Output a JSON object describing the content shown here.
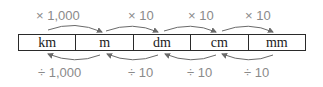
{
  "units": [
    {
      "label": "km"
    },
    {
      "label": "m"
    },
    {
      "label": "dm"
    },
    {
      "label": "cm"
    },
    {
      "label": "mm"
    }
  ],
  "multiply": [
    {
      "label": "× 1,000"
    },
    {
      "label": "× 10"
    },
    {
      "label": "× 10"
    },
    {
      "label": "× 10"
    }
  ],
  "divide": [
    {
      "label": "÷ 1,000"
    },
    {
      "label": "÷ 10"
    },
    {
      "label": "÷ 10"
    },
    {
      "label": "÷ 10"
    }
  ],
  "colors": {
    "text": "#1a1a1a",
    "operator": "#8a8a8a",
    "arrow": "#6a6a6a",
    "border": "#2a2a2a"
  }
}
